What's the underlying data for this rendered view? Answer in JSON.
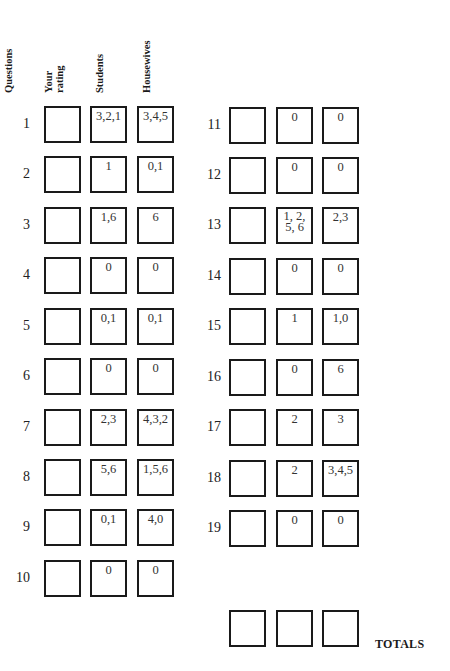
{
  "headers": {
    "questions": "Questions",
    "your_rating_1": "Your",
    "your_rating_2": "rating",
    "students": "Students",
    "housewives": "Housewives"
  },
  "rows": [
    {
      "q": "1",
      "rating": "",
      "students": "3,2,1",
      "housewives": "3,4,5"
    },
    {
      "q": "2",
      "rating": "",
      "students": "1",
      "housewives": "0,1"
    },
    {
      "q": "3",
      "rating": "",
      "students": "1,6",
      "housewives": "6"
    },
    {
      "q": "4",
      "rating": "",
      "students": "0",
      "housewives": "0"
    },
    {
      "q": "5",
      "rating": "",
      "students": "0,1",
      "housewives": "0,1"
    },
    {
      "q": "6",
      "rating": "",
      "students": "0",
      "housewives": "0"
    },
    {
      "q": "7",
      "rating": "",
      "students": "2,3",
      "housewives": "4,3,2"
    },
    {
      "q": "8",
      "rating": "",
      "students": "5,6",
      "housewives": "1,5,6"
    },
    {
      "q": "9",
      "rating": "",
      "students": "0,1",
      "housewives": "4,0"
    },
    {
      "q": "10",
      "rating": "",
      "students": "0",
      "housewives": "0"
    },
    {
      "q": "11",
      "rating": "",
      "students": "0",
      "housewives": "0"
    },
    {
      "q": "12",
      "rating": "",
      "students": "0",
      "housewives": "0"
    },
    {
      "q": "13",
      "rating": "",
      "students": "1, 2,\n5, 6",
      "housewives": "2,3"
    },
    {
      "q": "14",
      "rating": "",
      "students": "0",
      "housewives": "0"
    },
    {
      "q": "15",
      "rating": "",
      "students": "1",
      "housewives": "1,0"
    },
    {
      "q": "16",
      "rating": "",
      "students": "0",
      "housewives": "6"
    },
    {
      "q": "17",
      "rating": "",
      "students": "2",
      "housewives": "3"
    },
    {
      "q": "18",
      "rating": "",
      "students": "2",
      "housewives": "3,4,5"
    },
    {
      "q": "19",
      "rating": "",
      "students": "0",
      "housewives": "0"
    }
  ],
  "totals": {
    "label": "TOTALS",
    "your_rating": "",
    "students": "",
    "housewives": ""
  }
}
